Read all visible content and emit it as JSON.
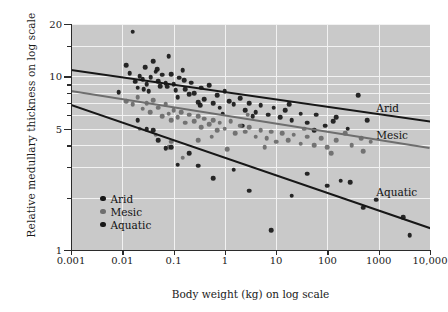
{
  "chart_data": {
    "type": "scatter",
    "title": "",
    "xlabel": "Body weight (kg) on log scale",
    "ylabel": "Relative medullary thickness on log scale",
    "xscale": "log",
    "yscale": "log",
    "xlim": [
      0.001,
      10000
    ],
    "ylim": [
      1,
      20
    ],
    "grid": true,
    "legend_position": "lower-left-inside",
    "xticks": [
      0.001,
      0.01,
      0.1,
      1,
      10,
      100,
      1000,
      10000
    ],
    "xticklabels": [
      "0.001",
      "0.01",
      "0.1",
      "1",
      "10",
      "100",
      "1000",
      "10,000"
    ],
    "yticks": [
      1,
      5,
      10,
      20
    ],
    "yticklabels": [
      "1",
      "5",
      "10",
      "20"
    ],
    "yminorticks": [
      2,
      3,
      4,
      6,
      7,
      8,
      9,
      15
    ],
    "colors": {
      "arid": "#171717",
      "mesic": "#6e6e6e",
      "aquatic": "#171717",
      "background": "#c9c9c9",
      "gridline": "#f2f2f2",
      "axis": "#2b2b2b"
    },
    "annotations": [
      {
        "text": "Arid",
        "x": 900,
        "y": 6.6
      },
      {
        "text": "Mesic",
        "x": 900,
        "y": 4.6
      },
      {
        "text": "Aquatic",
        "x": 900,
        "y": 2.15
      }
    ],
    "series": [
      {
        "name": "Arid",
        "color": "#171717",
        "fit": {
          "x0": 0.001,
          "y0": 11.0,
          "x1": 10000,
          "y1": 5.55
        },
        "points": [
          [
            0.0085,
            8.1
          ],
          [
            0.012,
            11.6
          ],
          [
            0.016,
            18.1
          ],
          [
            0.018,
            9.3
          ],
          [
            0.02,
            8.6
          ],
          [
            0.022,
            10.0
          ],
          [
            0.025,
            9.6
          ],
          [
            0.028,
            11.3
          ],
          [
            0.03,
            9.0
          ],
          [
            0.033,
            8.2
          ],
          [
            0.036,
            9.9
          ],
          [
            0.04,
            12.2
          ],
          [
            0.045,
            10.6
          ],
          [
            0.05,
            9.4
          ],
          [
            0.055,
            8.8
          ],
          [
            0.06,
            10.2
          ],
          [
            0.07,
            9.1
          ],
          [
            0.08,
            13.1
          ],
          [
            0.09,
            10.3
          ],
          [
            0.1,
            9.0
          ],
          [
            0.11,
            8.3
          ],
          [
            0.12,
            7.6
          ],
          [
            0.13,
            9.8
          ],
          [
            0.15,
            10.8
          ],
          [
            0.17,
            8.4
          ],
          [
            0.2,
            7.9
          ],
          [
            0.22,
            9.2
          ],
          [
            0.25,
            8.0
          ],
          [
            0.3,
            7.1
          ],
          [
            0.35,
            8.6
          ],
          [
            0.4,
            7.4
          ],
          [
            0.5,
            8.9
          ],
          [
            0.6,
            7.0
          ],
          [
            0.7,
            7.8
          ],
          [
            0.8,
            6.6
          ],
          [
            1.0,
            8.2
          ],
          [
            1.2,
            7.2
          ],
          [
            1.5,
            6.9
          ],
          [
            2.0,
            7.5
          ],
          [
            2.5,
            6.4
          ],
          [
            3.0,
            7.0
          ],
          [
            4.0,
            6.2
          ],
          [
            5.0,
            6.8
          ],
          [
            7.0,
            6.0
          ],
          [
            9.0,
            6.6
          ],
          [
            12.0,
            5.8
          ],
          [
            15.0,
            6.4
          ],
          [
            20.0,
            5.6
          ],
          [
            30.0,
            6.1
          ],
          [
            40.0,
            5.4
          ],
          [
            60.0,
            6.0
          ],
          [
            90.0,
            5.2
          ],
          [
            150.0,
            5.8
          ],
          [
            250.0,
            5.0
          ],
          [
            400.0,
            7.8
          ],
          [
            600.0,
            5.6
          ],
          [
            0.014,
            10.4
          ],
          [
            0.026,
            8.4
          ],
          [
            0.048,
            11.0
          ],
          [
            0.075,
            8.7
          ],
          [
            0.16,
            9.5
          ],
          [
            0.33,
            6.8
          ],
          [
            0.9,
            6.1
          ],
          [
            3.5,
            5.9
          ],
          [
            18.0,
            6.9
          ],
          [
            55.0,
            4.9
          ],
          [
            130.0,
            5.5
          ],
          [
            2.2,
            5.2
          ]
        ]
      },
      {
        "name": "Mesic",
        "color": "#6e6e6e",
        "fit": {
          "x0": 0.001,
          "y0": 8.3,
          "x1": 10000,
          "y1": 3.9
        },
        "points": [
          [
            0.012,
            7.2
          ],
          [
            0.016,
            6.9
          ],
          [
            0.02,
            7.6
          ],
          [
            0.025,
            6.5
          ],
          [
            0.03,
            7.0
          ],
          [
            0.035,
            6.2
          ],
          [
            0.04,
            7.3
          ],
          [
            0.05,
            6.6
          ],
          [
            0.06,
            5.9
          ],
          [
            0.07,
            6.9
          ],
          [
            0.08,
            6.1
          ],
          [
            0.09,
            5.6
          ],
          [
            0.1,
            6.4
          ],
          [
            0.12,
            5.8
          ],
          [
            0.14,
            6.2
          ],
          [
            0.17,
            5.4
          ],
          [
            0.2,
            6.0
          ],
          [
            0.25,
            5.5
          ],
          [
            0.3,
            5.9
          ],
          [
            0.35,
            5.1
          ],
          [
            0.4,
            5.7
          ],
          [
            0.5,
            5.3
          ],
          [
            0.6,
            5.6
          ],
          [
            0.7,
            4.9
          ],
          [
            0.8,
            5.4
          ],
          [
            1.0,
            5.0
          ],
          [
            1.3,
            5.5
          ],
          [
            1.6,
            4.7
          ],
          [
            2.0,
            5.2
          ],
          [
            2.5,
            4.8
          ],
          [
            3.0,
            5.1
          ],
          [
            4.0,
            4.5
          ],
          [
            5.0,
            4.9
          ],
          [
            6.5,
            4.4
          ],
          [
            8.0,
            4.8
          ],
          [
            10.0,
            4.2
          ],
          [
            13.0,
            4.7
          ],
          [
            17.0,
            4.3
          ],
          [
            22.0,
            4.6
          ],
          [
            30.0,
            4.1
          ],
          [
            40.0,
            4.5
          ],
          [
            55.0,
            4.0
          ],
          [
            75.0,
            4.4
          ],
          [
            100.0,
            3.9
          ],
          [
            150.0,
            4.3
          ],
          [
            220.0,
            4.7
          ],
          [
            300.0,
            4.0
          ],
          [
            450.0,
            4.4
          ],
          [
            700.0,
            4.2
          ],
          [
            0.045,
            4.6
          ],
          [
            0.08,
            3.9
          ],
          [
            0.15,
            3.4
          ],
          [
            0.09,
            4.2
          ],
          [
            1.1,
            3.8
          ],
          [
            2.8,
            6.0
          ],
          [
            0.022,
            5.0
          ],
          [
            35.0,
            5.0
          ],
          [
            0.3,
            4.3
          ],
          [
            6.0,
            3.9
          ],
          [
            0.55,
            4.5
          ],
          [
            120.0,
            3.6
          ],
          [
            500.0,
            3.7
          ]
        ]
      },
      {
        "name": "Aquatic",
        "color": "#171717",
        "fit": {
          "x0": 0.001,
          "y0": 6.9,
          "x1": 10000,
          "y1": 1.35
        },
        "points": [
          [
            0.02,
            5.6
          ],
          [
            0.03,
            4.95
          ],
          [
            0.04,
            4.9
          ],
          [
            0.07,
            3.85
          ],
          [
            0.09,
            3.9
          ],
          [
            0.12,
            3.1
          ],
          [
            0.3,
            3.05
          ],
          [
            1.5,
            2.9
          ],
          [
            8.0,
            1.3
          ],
          [
            40.0,
            2.75
          ],
          [
            100.0,
            2.35
          ],
          [
            180.0,
            2.5
          ],
          [
            280.0,
            2.45
          ],
          [
            900.0,
            1.95
          ],
          [
            3000.0,
            1.55
          ],
          [
            4000.0,
            1.22
          ],
          [
            0.05,
            4.3
          ],
          [
            0.2,
            3.6
          ],
          [
            0.6,
            2.6
          ],
          [
            3.0,
            2.2
          ],
          [
            20.0,
            2.05
          ],
          [
            500.0,
            1.75
          ]
        ]
      }
    ]
  }
}
